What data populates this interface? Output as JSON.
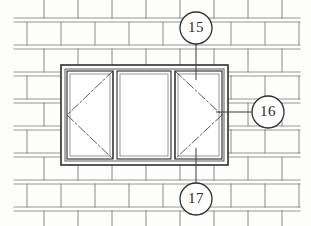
{
  "drawing": {
    "title": "Window Elevation in Brick Wall",
    "sheet_width": 311,
    "sheet_height": 226,
    "background_color": "#fdfdfc",
    "line_color": "#3a3a3a",
    "mortar_line_color": "#8d8d8d",
    "brick_line_color": "#707070"
  },
  "wall": {
    "name": "brick-wall",
    "pattern": "running-bond",
    "course_height": 27,
    "brick_length": 68,
    "courses": [
      {
        "y": 18,
        "offset": 0
      },
      {
        "y": 45,
        "offset": 34
      },
      {
        "y": 72,
        "offset": 0
      },
      {
        "y": 99,
        "offset": 34
      },
      {
        "y": 126,
        "offset": 0
      },
      {
        "y": 153,
        "offset": 34
      },
      {
        "y": 180,
        "offset": 0
      },
      {
        "y": 207,
        "offset": 34
      }
    ]
  },
  "window": {
    "name": "window-assembly",
    "outer_frame": {
      "x": 61,
      "y": 65,
      "width": 167,
      "height": 100
    },
    "inner_frame_inset": 4,
    "panes": [
      {
        "id": "left-sash",
        "label": "Left casement sash",
        "x": 67,
        "y": 71,
        "width": 46,
        "height": 88,
        "swing": "left",
        "swing_symbol": "hinge-triangle-left"
      },
      {
        "id": "center-fixed",
        "label": "Fixed center light",
        "x": 117,
        "y": 71,
        "width": 54,
        "height": 88,
        "swing": "none",
        "swing_symbol": "none"
      },
      {
        "id": "right-sash",
        "label": "Right casement sash",
        "x": 175,
        "y": 71,
        "width": 47,
        "height": 88,
        "swing": "right",
        "swing_symbol": "hinge-triangle-right"
      }
    ]
  },
  "callouts": [
    {
      "id": "callout-15",
      "number": "15",
      "cx": 196,
      "cy": 28,
      "r": 16,
      "leader": {
        "x1": 196,
        "y1": 44,
        "x2": 196,
        "y2": 80
      },
      "position": "top"
    },
    {
      "id": "callout-16",
      "number": "16",
      "cx": 268,
      "cy": 112,
      "r": 16,
      "leader": {
        "x1": 252,
        "y1": 112,
        "x2": 216,
        "y2": 112
      },
      "position": "right"
    },
    {
      "id": "callout-17",
      "number": "17",
      "cx": 196,
      "cy": 199,
      "r": 16,
      "leader": {
        "x1": 196,
        "y1": 183,
        "x2": 196,
        "y2": 148
      },
      "position": "bottom"
    }
  ]
}
